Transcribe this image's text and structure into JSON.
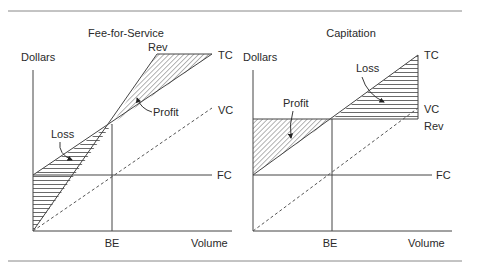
{
  "figure": {
    "panels": [
      {
        "title": "Fee-for-Service",
        "y_axis_label": "Dollars",
        "x_axis_label": "Volume",
        "break_even_label": "BE",
        "lines": {
          "rev": "Rev",
          "tc": "TC",
          "vc": "VC",
          "fc": "FC"
        },
        "regions": {
          "profit": "Profit",
          "loss": "Loss"
        }
      },
      {
        "title": "Capitation",
        "y_axis_label": "Dollars",
        "x_axis_label": "Volume",
        "break_even_label": "BE",
        "lines": {
          "rev": "Rev",
          "tc": "TC",
          "vc": "VC",
          "fc": "FC"
        },
        "regions": {
          "profit": "Profit",
          "loss": "Loss"
        }
      }
    ],
    "colors": {
      "line": "#444444",
      "text": "#2a2a2a",
      "rule": "#888888"
    }
  }
}
